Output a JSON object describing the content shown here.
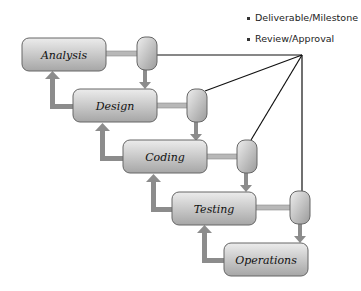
{
  "legend": {
    "items": [
      {
        "label": "Deliverable/Milestone"
      },
      {
        "label": "Review/Approval"
      }
    ]
  },
  "stages": [
    {
      "label": "Analysis"
    },
    {
      "label": "Design"
    },
    {
      "label": "Coding"
    },
    {
      "label": "Testing"
    },
    {
      "label": "Operations"
    }
  ],
  "colors": {
    "box_fill_top": "#e6e6e6",
    "box_fill_bottom": "#a8a8a8",
    "box_stroke": "#666666",
    "arrow": "#8c8c8c",
    "line": "#111111"
  }
}
